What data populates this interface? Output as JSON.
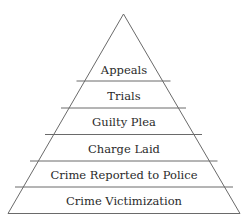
{
  "diagram": {
    "type": "pyramid",
    "levels": [
      {
        "label": "Appeals"
      },
      {
        "label": "Trials"
      },
      {
        "label": "Guilty Plea"
      },
      {
        "label": "Charge Laid"
      },
      {
        "label": "Crime Reported to Police"
      },
      {
        "label": "Crime Victimization"
      }
    ],
    "colors": {
      "line": "#6a6a6a",
      "text": "#2a2a2a",
      "background": "#ffffff"
    }
  }
}
